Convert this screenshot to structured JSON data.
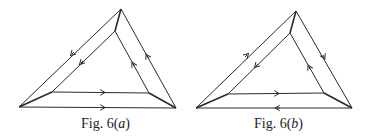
{
  "figures": [
    {
      "id": "a",
      "caption_prefix": "Fig. 6(",
      "caption_letter": "a",
      "caption_suffix": ")",
      "outer": {
        "top": [
          121,
          9
        ],
        "left": [
          19,
          107
        ],
        "right": [
          176,
          108
        ]
      },
      "inner": {
        "top": [
          115,
          31
        ],
        "left": [
          52,
          92
        ],
        "right": [
          149,
          93
        ]
      },
      "arrows": {
        "outer_left": "down-left",
        "inner_left": "down-left",
        "inner_right": "up",
        "outer_right": "up",
        "inner_bottom": "right",
        "outer_bottom": "right"
      }
    },
    {
      "id": "b",
      "caption_prefix": "Fig. 6(",
      "caption_letter": "b",
      "caption_suffix": ")",
      "outer": {
        "top": [
          296,
          11
        ],
        "left": [
          196,
          108
        ],
        "right": [
          352,
          108
        ]
      },
      "inner": {
        "top": [
          290,
          33
        ],
        "left": [
          228,
          94
        ],
        "right": [
          324,
          93
        ]
      },
      "arrows": {
        "outer_left": "up-right",
        "inner_left": "down-left",
        "inner_right": "up",
        "outer_right": "down",
        "inner_bottom": "right",
        "outer_bottom": "left"
      }
    }
  ],
  "colors": {
    "line": "#2a2a2a",
    "background": "#ffffff"
  }
}
